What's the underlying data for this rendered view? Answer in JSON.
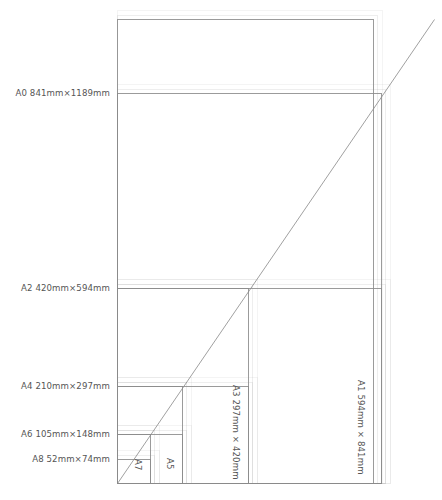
{
  "diagram": {
    "background_color": "#ffffff",
    "stroke_color": "#8a8a8a",
    "text_color": "#555555",
    "origin_x": 117,
    "origin_y": 483,
    "diagonal": {
      "from": [
        117,
        483
      ],
      "to": [
        434,
        19
      ]
    },
    "sizes": [
      {
        "key": "A0",
        "label": "A0 841mm×1189mm",
        "width_mm": 841,
        "height_mm": 1189,
        "orientation": "horizontal",
        "x": 117,
        "y": 93,
        "w": 264,
        "h": 390
      },
      {
        "key": "A1",
        "label": "A1 594mm × 841mm",
        "width_mm": 594,
        "height_mm": 841,
        "orientation": "vertical",
        "x": 117,
        "y": 19,
        "w": 256,
        "h": 464
      },
      {
        "key": "A2",
        "label": "A2 420mm×594mm",
        "width_mm": 420,
        "height_mm": 594,
        "orientation": "horizontal",
        "x": 117,
        "y": 288,
        "w": 264,
        "h": 195
      },
      {
        "key": "A3",
        "label": "A3 297mm × 420mm",
        "width_mm": 297,
        "height_mm": 420,
        "orientation": "vertical",
        "x": 117,
        "y": 288,
        "w": 131,
        "h": 195
      },
      {
        "key": "A4",
        "label": "A4 210mm×297mm",
        "width_mm": 210,
        "height_mm": 297,
        "orientation": "horizontal",
        "x": 117,
        "y": 386,
        "w": 131,
        "h": 97
      },
      {
        "key": "A5",
        "label": "A5",
        "width_mm": 148,
        "height_mm": 210,
        "orientation": "vertical",
        "x": 117,
        "y": 386,
        "w": 65,
        "h": 97
      },
      {
        "key": "A6",
        "label": "A6 105mm×148mm",
        "width_mm": 105,
        "height_mm": 148,
        "orientation": "horizontal",
        "x": 117,
        "y": 434,
        "w": 65,
        "h": 49
      },
      {
        "key": "A7",
        "label": "A7",
        "width_mm": 74,
        "height_mm": 105,
        "orientation": "vertical",
        "x": 117,
        "y": 434,
        "w": 33,
        "h": 49
      },
      {
        "key": "A8",
        "label": "A8 52mm×74mm",
        "width_mm": 52,
        "height_mm": 74,
        "orientation": "horizontal",
        "x": 117,
        "y": 459,
        "w": 33,
        "h": 24
      }
    ],
    "left_labels": [
      {
        "key": "A0",
        "text": "A0 841mm×1189mm",
        "y": 93
      },
      {
        "key": "A2",
        "text": "A2 420mm×594mm",
        "y": 288
      },
      {
        "key": "A4",
        "text": "A4 210mm×297mm",
        "y": 386
      },
      {
        "key": "A6",
        "text": "A6 105mm×148mm",
        "y": 434
      },
      {
        "key": "A8",
        "text": "A8 52mm×74mm",
        "y": 459
      }
    ],
    "vertical_labels": [
      {
        "key": "A1",
        "text": "A1 594mm × 841mm",
        "x": 366,
        "y": 380
      },
      {
        "key": "A3",
        "text": "A3 297mm × 420mm",
        "x": 241,
        "y": 385
      },
      {
        "key": "A5",
        "text": "A5",
        "x": 175,
        "y": 458
      },
      {
        "key": "A7",
        "text": "A7",
        "x": 143,
        "y": 459
      }
    ]
  }
}
